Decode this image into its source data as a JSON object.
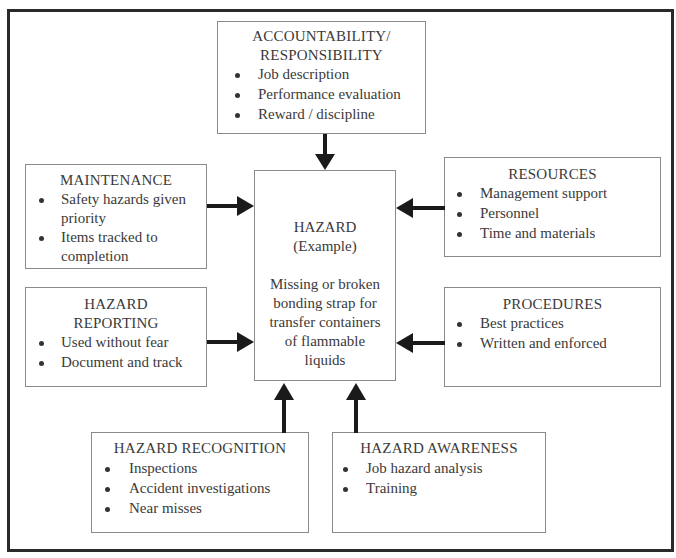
{
  "diagram": {
    "center": {
      "title": "HAZARD",
      "subtitle": "(Example)",
      "description_lines": [
        "Missing or broken",
        "bonding strap for",
        "transfer containers",
        "of flammable",
        "liquids"
      ]
    },
    "boxes": {
      "accountability": {
        "title_lines": [
          "ACCOUNTABILITY/",
          "RESPONSIBILITY"
        ],
        "items": [
          "Job description",
          "Performance evaluation",
          "Reward / discipline"
        ]
      },
      "maintenance": {
        "title_lines": [
          "MAINTENANCE"
        ],
        "items": [
          [
            "Safety hazards given",
            "priority"
          ],
          [
            "Items tracked to",
            "completion"
          ]
        ]
      },
      "hazard_reporting": {
        "title_lines": [
          "HAZARD",
          "REPORTING"
        ],
        "items": [
          "Used without fear",
          "Document and track"
        ]
      },
      "resources": {
        "title_lines": [
          "RESOURCES"
        ],
        "items": [
          "Management support",
          "Personnel",
          "Time and materials"
        ]
      },
      "procedures": {
        "title_lines": [
          "PROCEDURES"
        ],
        "items": [
          "Best practices",
          "Written and enforced"
        ]
      },
      "hazard_recognition": {
        "title_lines": [
          "HAZARD RECOGNITION"
        ],
        "items": [
          "Inspections",
          "Accident investigations",
          "Near misses"
        ]
      },
      "hazard_awareness": {
        "title_lines": [
          "HAZARD AWARENESS"
        ],
        "items": [
          "Job hazard analysis",
          "Training"
        ]
      }
    },
    "arrows": [
      {
        "from": "accountability",
        "to": "center",
        "direction": "down"
      },
      {
        "from": "maintenance",
        "to": "center",
        "direction": "right"
      },
      {
        "from": "hazard_reporting",
        "to": "center",
        "direction": "right"
      },
      {
        "from": "resources",
        "to": "center",
        "direction": "left"
      },
      {
        "from": "procedures",
        "to": "center",
        "direction": "left"
      },
      {
        "from": "hazard_recognition",
        "to": "center",
        "direction": "up"
      },
      {
        "from": "hazard_awareness",
        "to": "center",
        "direction": "up"
      }
    ],
    "colors": {
      "frame": "#2a2a2a",
      "box_border": "#8a8a8a",
      "arrow": "#1a1a1a",
      "text": "#3a3a3a"
    }
  }
}
